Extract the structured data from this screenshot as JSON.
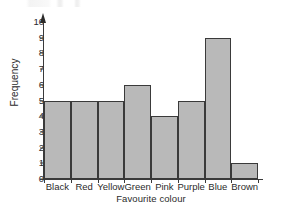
{
  "chart_data": {
    "type": "bar",
    "title": "",
    "subtitle": "",
    "xlabel": "Favourite colour",
    "ylabel": "Frequency",
    "categories": [
      "Black",
      "Red",
      "Yellow",
      "Green",
      "Pink",
      "Purple",
      "Blue",
      "Brown"
    ],
    "values": [
      5,
      5,
      5,
      6,
      4,
      5,
      9,
      1
    ],
    "ylim": [
      0,
      10
    ],
    "ytick_labels": [
      "0",
      "1",
      "2",
      "3",
      "4",
      "5",
      "6",
      "7",
      "8",
      "9",
      "10"
    ],
    "ytick_values": [
      0,
      1,
      2,
      3,
      4,
      5,
      6,
      7,
      8,
      9,
      10
    ],
    "grid": false,
    "legend": null,
    "legend_position": "none",
    "annotations": [],
    "bars_adjacent": true,
    "bar_fill_color": "#b9b9b9",
    "bar_edge_color": "#3a3a3a",
    "axis_color": "#3a3a3a",
    "text_color": "#2b2b2b",
    "background_color": "#ffffff",
    "y_axis_has_arrowhead": true
  }
}
